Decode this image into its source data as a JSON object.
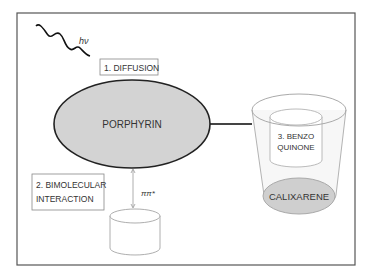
{
  "diagram": {
    "light_label": "hν",
    "step1_label": "1. DIFFUSION",
    "porphyrin_label": "PORPHYRIN",
    "step2_line1": "2. BIMOLECULAR",
    "step2_line2": "INTERACTION",
    "pi_label": "ππ*",
    "step3_line1": "3. BENZO",
    "step3_line2": "QUINONE",
    "calixarene_label": "CALIXARENE"
  },
  "colors": {
    "frame": "#555555",
    "porphyrin_fill": "#d3d3d3",
    "porphyrin_stroke": "#222222",
    "calixarene_fill": "#cfcfcf",
    "cup_stroke": "#aaaaaa"
  }
}
